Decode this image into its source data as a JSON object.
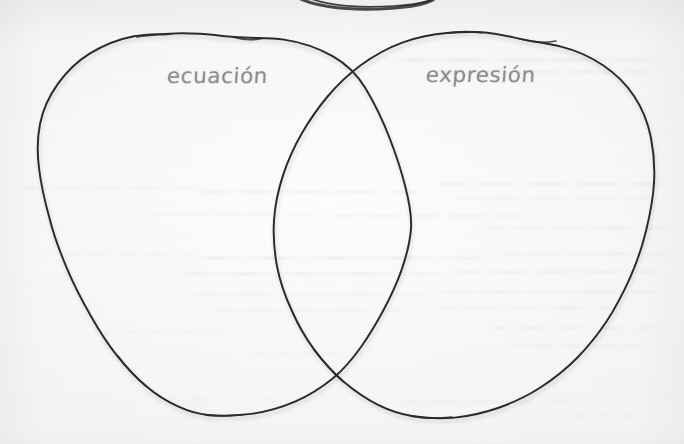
{
  "diagram": {
    "kind": "venn-diagram",
    "medium": "hand-drawn-on-paper",
    "title_text": "",
    "sets": [
      {
        "id": "left",
        "label": "ecuación",
        "label_position": "top-left-inside",
        "items": []
      },
      {
        "id": "right",
        "label": "expresión",
        "label_position": "top-right-inside",
        "items": []
      }
    ],
    "intersection": {
      "label": "",
      "items": []
    },
    "colors": {
      "paper": "#f8f8f8",
      "ink": "#2b2b2b",
      "label_text": "#8d8d8f",
      "bleed_through": "#787880"
    },
    "strokes": {
      "ink_width_px": 1.9,
      "style": "wobbly-freehand"
    },
    "artifacts": {
      "top_edge_arc": "partial ink arc cropped at top edge of page",
      "bleed_through": "faint mirrored handwriting showing through from reverse side"
    },
    "geometry": {
      "left_circle": {
        "cx": 224,
        "cy": 226,
        "rx": 187,
        "ry": 192
      },
      "right_circle": {
        "cx": 480,
        "cy": 226,
        "rx": 186,
        "ry": 193
      },
      "crossing_upper": {
        "x": 363,
        "y": 88
      },
      "crossing_lower": {
        "x": 360,
        "y": 363
      }
    }
  },
  "bleed_lines": [
    {
      "x": 392,
      "y": 58,
      "w": 268,
      "o": 0.55
    },
    {
      "x": 432,
      "y": 70,
      "w": 228,
      "o": 0.4
    },
    {
      "x": 20,
      "y": 186,
      "w": 180,
      "o": 0.32
    },
    {
      "x": 196,
      "y": 190,
      "w": 230,
      "o": 0.46
    },
    {
      "x": 434,
      "y": 182,
      "w": 236,
      "o": 0.5
    },
    {
      "x": 448,
      "y": 196,
      "w": 210,
      "o": 0.34
    },
    {
      "x": 148,
      "y": 212,
      "w": 168,
      "o": 0.3
    },
    {
      "x": 330,
      "y": 214,
      "w": 198,
      "o": 0.36
    },
    {
      "x": 480,
      "y": 226,
      "w": 190,
      "o": 0.42
    },
    {
      "x": 60,
      "y": 252,
      "w": 142,
      "o": 0.26
    },
    {
      "x": 194,
      "y": 256,
      "w": 300,
      "o": 0.48
    },
    {
      "x": 500,
      "y": 252,
      "w": 170,
      "o": 0.38
    },
    {
      "x": 176,
      "y": 272,
      "w": 268,
      "o": 0.44
    },
    {
      "x": 452,
      "y": 270,
      "w": 214,
      "o": 0.4
    },
    {
      "x": 188,
      "y": 292,
      "w": 246,
      "o": 0.36
    },
    {
      "x": 440,
      "y": 290,
      "w": 226,
      "o": 0.42
    },
    {
      "x": 208,
      "y": 308,
      "w": 202,
      "o": 0.3
    },
    {
      "x": 432,
      "y": 306,
      "w": 196,
      "o": 0.34
    },
    {
      "x": 100,
      "y": 330,
      "w": 126,
      "o": 0.22
    },
    {
      "x": 486,
      "y": 326,
      "w": 178,
      "o": 0.32
    },
    {
      "x": 506,
      "y": 344,
      "w": 140,
      "o": 0.26
    },
    {
      "x": 250,
      "y": 352,
      "w": 120,
      "o": 0.2
    },
    {
      "x": 160,
      "y": 398,
      "w": 150,
      "o": 0.22
    },
    {
      "x": 398,
      "y": 400,
      "w": 180,
      "o": 0.26
    },
    {
      "x": 548,
      "y": 414,
      "w": 118,
      "o": 0.2
    }
  ]
}
